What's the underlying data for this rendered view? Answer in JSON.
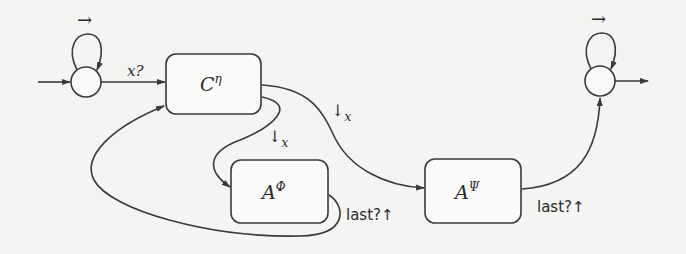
{
  "diagram": {
    "type": "automaton",
    "states": {
      "initial": {
        "loop_label": "→"
      },
      "final": {
        "loop_label": "→"
      }
    },
    "boxes": {
      "c_eta": {
        "base": "C",
        "sup": "η"
      },
      "a_phi": {
        "base": "A",
        "sup": "Φ"
      },
      "a_psi": {
        "base": "A",
        "sup": "Ψ"
      }
    },
    "edges": {
      "init_to_c": {
        "label": "x?"
      },
      "c_to_aphi": {
        "arrow": "↓",
        "sub": "x"
      },
      "c_to_apsi": {
        "arrow": "↓",
        "sub": "x"
      },
      "aphi_to_c": {
        "label": "last?↑"
      },
      "apsi_to_final": {
        "label": "last?↑"
      }
    }
  }
}
